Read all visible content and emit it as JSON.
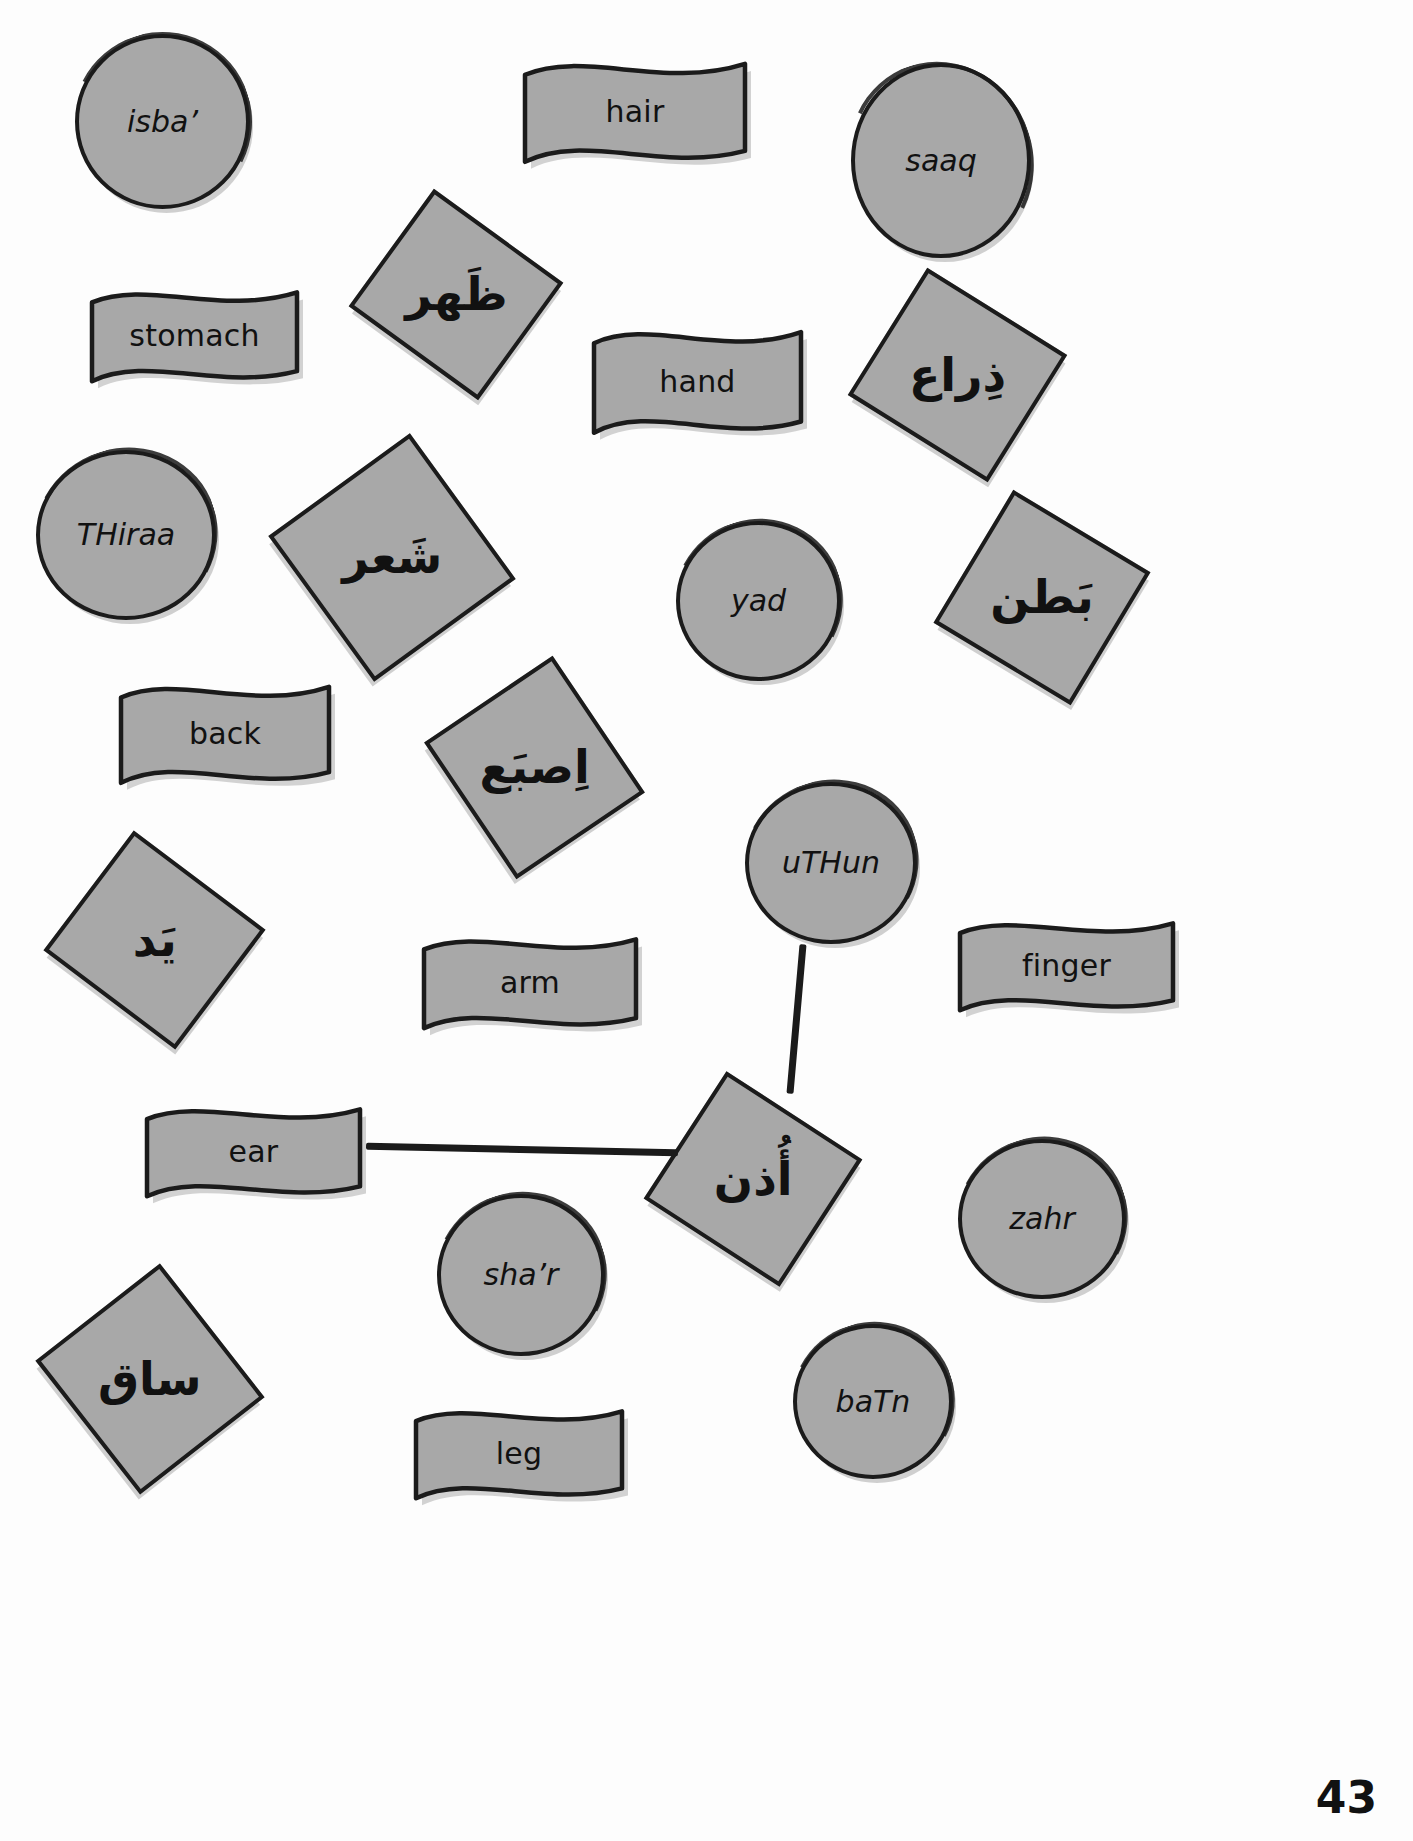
{
  "page": {
    "page_number": "43",
    "background_color": "#ffffff",
    "shape_fill_color": "#a8a8a8",
    "shape_outline_color": "#1b1b1b"
  },
  "cards": [
    {
      "id": "isba-circle",
      "text": "isba’",
      "script": "latin",
      "shape": "circle",
      "x": 75,
      "y": 34,
      "w": 175,
      "h": 175,
      "rot": 0,
      "font": "txt-tr"
    },
    {
      "id": "hair-banner",
      "text": "hair",
      "script": "latin",
      "shape": "banner",
      "x": 519,
      "y": 52,
      "w": 232,
      "h": 120,
      "rot": 0,
      "font": "txt-en"
    },
    {
      "id": "saaq-circle",
      "text": "saaq",
      "script": "latin",
      "shape": "circle",
      "x": 851,
      "y": 63,
      "w": 180,
      "h": 195,
      "rot": 0,
      "font": "txt-tr"
    },
    {
      "id": "THahr-diamond",
      "text": "ظَهر",
      "script": "arabic",
      "shape": "diamond",
      "x": 376,
      "y": 222,
      "w": 160,
      "h": 145,
      "rot": -9,
      "font": "txt-ar"
    },
    {
      "id": "stomach-banner",
      "text": "stomach",
      "script": "latin",
      "shape": "banner",
      "x": 86,
      "y": 281,
      "w": 217,
      "h": 110,
      "rot": 0,
      "font": "txt-en"
    },
    {
      "id": "hand-banner",
      "text": "hand",
      "script": "latin",
      "shape": "banner",
      "x": 588,
      "y": 320,
      "w": 219,
      "h": 123,
      "rot": 0,
      "font": "txt-en"
    },
    {
      "id": "thiraa-diamond",
      "text": "ذِراع",
      "script": "arabic",
      "shape": "diamond",
      "x": 875,
      "y": 300,
      "w": 165,
      "h": 150,
      "rot": -13,
      "font": "txt-ar"
    },
    {
      "id": "THiraa-circle",
      "text": "THiraa",
      "script": "latin",
      "shape": "circle",
      "x": 36,
      "y": 450,
      "w": 180,
      "h": 170,
      "rot": 0,
      "font": "txt-tr"
    },
    {
      "id": "shar-diamond",
      "text": "شَعر",
      "script": "arabic",
      "shape": "diamond",
      "x": 302,
      "y": 470,
      "w": 180,
      "h": 175,
      "rot": 9,
      "font": "txt-ar"
    },
    {
      "id": "yad-circle",
      "text": "yad",
      "script": "latin",
      "shape": "circle",
      "x": 676,
      "y": 521,
      "w": 165,
      "h": 160,
      "rot": 0,
      "font": "txt-tr"
    },
    {
      "id": "batn-diamond",
      "text": "بَطن",
      "script": "arabic",
      "shape": "diamond",
      "x": 962,
      "y": 520,
      "w": 160,
      "h": 155,
      "rot": -14,
      "font": "txt-ar"
    },
    {
      "id": "back-banner",
      "text": "back",
      "script": "latin",
      "shape": "banner",
      "x": 115,
      "y": 675,
      "w": 220,
      "h": 118,
      "rot": 0,
      "font": "txt-en"
    },
    {
      "id": "isba-diamond",
      "text": "اِصبَع",
      "script": "arabic",
      "shape": "diamond",
      "x": 452,
      "y": 690,
      "w": 165,
      "h": 155,
      "rot": 11,
      "font": "txt-ar"
    },
    {
      "id": "uTHun-circle",
      "text": "uTHun",
      "script": "latin",
      "shape": "circle",
      "x": 745,
      "y": 782,
      "w": 172,
      "h": 162,
      "rot": 0,
      "font": "txt-tr"
    },
    {
      "id": "yad-diamond",
      "text": "يَد",
      "script": "arabic",
      "shape": "diamond",
      "x": 72,
      "y": 865,
      "w": 165,
      "h": 150,
      "rot": -8,
      "font": "txt-ar"
    },
    {
      "id": "arm-banner",
      "text": "arm",
      "script": "latin",
      "shape": "banner",
      "x": 418,
      "y": 928,
      "w": 224,
      "h": 110,
      "rot": 0,
      "font": "txt-en"
    },
    {
      "id": "finger-banner",
      "text": "finger",
      "script": "latin",
      "shape": "banner",
      "x": 954,
      "y": 912,
      "w": 225,
      "h": 108,
      "rot": 0,
      "font": "txt-en"
    },
    {
      "id": "ear-banner",
      "text": "ear",
      "script": "latin",
      "shape": "banner",
      "x": 141,
      "y": 1098,
      "w": 225,
      "h": 108,
      "rot": 0,
      "font": "txt-en"
    },
    {
      "id": "uTHun-diamond",
      "text": "أُذن",
      "script": "arabic",
      "shape": "diamond",
      "x": 672,
      "y": 1103,
      "w": 162,
      "h": 152,
      "rot": -12,
      "font": "txt-ar"
    },
    {
      "id": "zahr-circle",
      "text": "zahr",
      "script": "latin",
      "shape": "circle",
      "x": 958,
      "y": 1139,
      "w": 168,
      "h": 160,
      "rot": 0,
      "font": "txt-tr"
    },
    {
      "id": "shar-circle",
      "text": "sha’r",
      "script": "latin",
      "shape": "circle",
      "x": 437,
      "y": 1194,
      "w": 168,
      "h": 162,
      "rot": 0,
      "font": "txt-tr"
    },
    {
      "id": "saaq-diamond",
      "text": "ساق",
      "script": "arabic",
      "shape": "diamond",
      "x": 65,
      "y": 1300,
      "w": 170,
      "h": 158,
      "rot": 7,
      "font": "txt-ar"
    },
    {
      "id": "batn-circle",
      "text": "baTn",
      "script": "latin",
      "shape": "circle",
      "x": 793,
      "y": 1324,
      "w": 160,
      "h": 155,
      "rot": 0,
      "font": "txt-tr"
    },
    {
      "id": "leg-banner",
      "text": "leg",
      "script": "latin",
      "shape": "banner",
      "x": 410,
      "y": 1400,
      "w": 218,
      "h": 108,
      "rot": 0,
      "font": "txt-en"
    }
  ],
  "connectors": [
    {
      "id": "connector-ear-to-uthun-diamond",
      "x": 366,
      "y": 1146,
      "w": 312,
      "h": 7,
      "rot": 1.2
    },
    {
      "id": "connector-uthun-circle-to-diamond",
      "x": 793,
      "y": 944,
      "w": 7,
      "h": 150,
      "rot": 5
    }
  ]
}
